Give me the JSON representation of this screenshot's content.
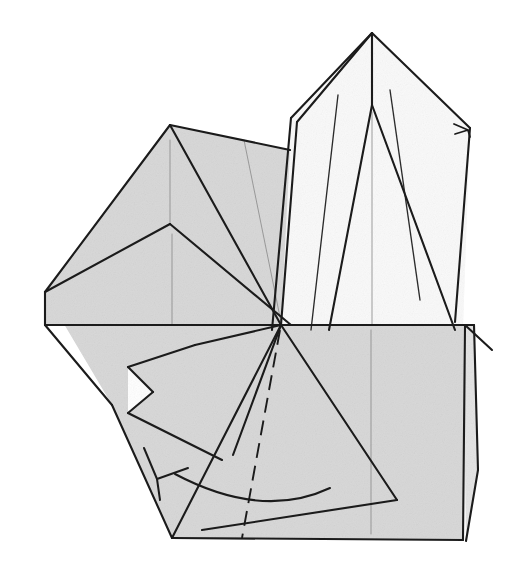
{
  "figure": {
    "kind": "origami-fold-diagram",
    "canvas": {
      "width": 515,
      "height": 576
    },
    "background_color": "#ffffff"
  },
  "palette": {
    "shaded_face": "#d7d7d7",
    "light_face": "#fafafa",
    "mid_face": "#e3e3e3",
    "white_face": "#ffffff",
    "major_edge": "#1b1b1b",
    "minor_edge": "#2a2a2a",
    "hairline": "#8d8d8d"
  },
  "faces": [
    {
      "name": "upper-right-light-panel",
      "tone": "light",
      "points": "372,33 290,118 272,330 463,330 470,128 438,95"
    },
    {
      "name": "lower-body-shaded-panel",
      "tone": "shaded",
      "points": "45,292 170,125 290,150 281,325 465,325 463,540 172,538 112,405"
    },
    {
      "name": "right-lower-flap",
      "tone": "mid",
      "points": "463,325 474,325 478,470 466,541"
    },
    {
      "name": "left-beak-tip",
      "tone": "shaded",
      "points": "45,292 170,224 281,325 45,325"
    },
    {
      "name": "notch-white-triangle",
      "tone": "white",
      "points": "128,367 128,413 153,392"
    }
  ],
  "edges": {
    "major": [
      {
        "name": "apex-left-ridge",
        "d": "M372,33 L291,118"
      },
      {
        "name": "apex-left-ridge-inner",
        "d": "M372,33 L297,122"
      },
      {
        "name": "apex-right-ridge",
        "d": "M372,33 L470,128"
      },
      {
        "name": "apex-spine-upper",
        "d": "M372,33 L372,105"
      },
      {
        "name": "spine-fan-left",
        "d": "M372,105 L329,330"
      },
      {
        "name": "spine-fan-right",
        "d": "M372,105 L455,330"
      },
      {
        "name": "left-flap-outer",
        "d": "M291,118 L272,330"
      },
      {
        "name": "left-flap-inner",
        "d": "M297,122 L281,325"
      },
      {
        "name": "gray-top-left-apex-to-left",
        "d": "M170,125 L45,292"
      },
      {
        "name": "gray-top-ridge",
        "d": "M170,125 L290,150"
      },
      {
        "name": "gray-top-apex-diagonal",
        "d": "M170,125 L281,325"
      },
      {
        "name": "mid-left-vertex-to-left-edge",
        "d": "M170,224 L45,292"
      },
      {
        "name": "mid-left-vertex-diagonal",
        "d": "M170,224 L291,325"
      },
      {
        "name": "left-edge-down",
        "d": "M45,292 L45,325"
      },
      {
        "name": "left-edge-lower",
        "d": "M45,325 L112,405"
      },
      {
        "name": "left-lower-to-bottom",
        "d": "M112,405 L172,538"
      },
      {
        "name": "horizon-line",
        "d": "M45,325 L465,325"
      },
      {
        "name": "horizon-line-right",
        "d": "M465,325 L474,325"
      },
      {
        "name": "bottom-edge",
        "d": "M172,538 L463,540"
      },
      {
        "name": "right-edge",
        "d": "M465,325 L463,540"
      },
      {
        "name": "right-flap-edge",
        "d": "M474,325 L478,470 L466,541"
      },
      {
        "name": "inner-fold-left-branch",
        "d": "M281,325 L195,345"
      },
      {
        "name": "triangle-flap-upper",
        "d": "M195,345 L128,367"
      },
      {
        "name": "triangle-flap-notch-a",
        "d": "M128,367 L153,392"
      },
      {
        "name": "triangle-flap-notch-b",
        "d": "M153,392 L128,413"
      },
      {
        "name": "triangle-flap-lower",
        "d": "M128,413 L222,460"
      },
      {
        "name": "inner-fold-right-branch",
        "d": "M281,325 L233,455"
      },
      {
        "name": "big-triangle-left",
        "d": "M281,325 L172,538"
      },
      {
        "name": "big-triangle-right",
        "d": "M281,325 L397,500"
      },
      {
        "name": "big-triangle-base",
        "d": "M397,500 L202,530"
      },
      {
        "name": "upper-right-tail",
        "d": "M470,128 L455,322"
      },
      {
        "name": "right-corner-spur",
        "d": "M465,325 L492,350"
      }
    ],
    "minor": [
      {
        "name": "light-panel-crease-left",
        "d": "M338,95 L311,330"
      },
      {
        "name": "light-panel-crease-right",
        "d": "M390,90 L420,300"
      }
    ],
    "hairlines": [
      {
        "name": "gray-crease-vertical-left",
        "d": "M170,140 L170,224"
      },
      {
        "name": "gray-crease-vertical-mid",
        "d": "M172,234 L172,325"
      },
      {
        "name": "gray-crease-diagonal",
        "d": "M244,140 L281,322"
      },
      {
        "name": "light-spine-vertical",
        "d": "M372,112 L372,325"
      },
      {
        "name": "lower-vertical-crease",
        "d": "M371,330 L371,534"
      },
      {
        "name": "beak-hairline",
        "d": "M48,325 L120,325"
      }
    ],
    "dashed": [
      {
        "name": "valley-fold-dashed",
        "d": "M280,330 L242,538"
      }
    ]
  },
  "annotations": {
    "fold_arrow": {
      "name": "rotate-fold-arrow",
      "shaft": "M330,488 Q262,520 175,474",
      "head": "M144,448 L157,479 L188,468",
      "tail_tick": "M157,479 L160,500"
    },
    "tip_marker": {
      "name": "edge-tip-arrowhead",
      "d": "M454,124 L468,130 L455,134 M468,130 L470,137"
    }
  }
}
